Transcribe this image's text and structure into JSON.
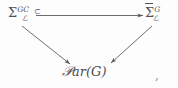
{
  "figure": {
    "type": "commutative-diagram",
    "background_color": "#fdfdfd",
    "ink_color": "#535353"
  },
  "nodes": {
    "top_left": {
      "name": "Sigma-G-C-script-L",
      "base": "Σ",
      "superscript": "GC",
      "subscript": "ℒ",
      "overline": false,
      "trailing_symbol": "⊂",
      "full_text": "Σℒ^{G_C}"
    },
    "top_right": {
      "name": "Sigma-bar-G-script-L",
      "base": "Σ",
      "superscript": "G",
      "subscript": "ℒ",
      "overline": true,
      "trailing_symbol": "",
      "full_text": "Σ̅ℒ^{G}"
    },
    "bottom": {
      "name": "Par-of-G",
      "script_letter": "𝒫",
      "rest": "ar(G)",
      "full_text": "𝒫ar(G)"
    }
  },
  "arrows": [
    {
      "id": "top-horizontal",
      "from": "top_left",
      "to": "top_right",
      "label": "",
      "direction": "right"
    },
    {
      "id": "left-diagonal",
      "from": "top_left",
      "to": "bottom",
      "label": "",
      "direction": "down-right"
    },
    {
      "id": "right-diagonal",
      "from": "top_right",
      "to": "bottom",
      "label": "",
      "direction": "down-left"
    }
  ],
  "punctuation": {
    "trailing_comma": ","
  }
}
